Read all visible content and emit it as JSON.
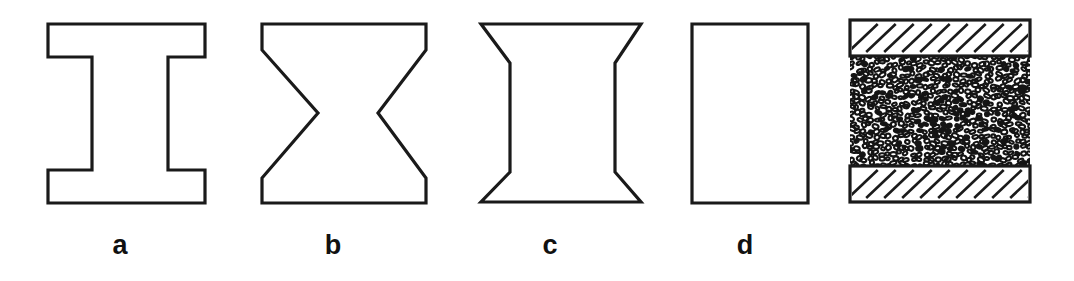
{
  "figure": {
    "kind": "specimen-geometry-diagram",
    "background_color": "#ffffff",
    "line_color": "#1a1a1a",
    "width": 1074,
    "height": 281,
    "panels": [
      {
        "id": "a",
        "label": "a",
        "shape_name": "i-beam-dogbone-specimen",
        "description": "I-shaped specimen with wide square top and bottom flanges and a straight narrow central web",
        "label_x": 120,
        "label_y": 232,
        "outline_points": "48,24 205,24 205,57 168,57 168,170 205,170 205,203 48,203 48,170 92,170 92,57 48,57"
      },
      {
        "id": "b",
        "label": "b",
        "shape_name": "hourglass-bowtie-specimen",
        "description": "Hourglass specimen with straight tapered sides converging to a sharp V notch at mid height",
        "label_x": 333,
        "label_y": 232,
        "outline_points": "262,24 426,24 426,50 378,113 426,178 426,203 262,203 262,178 318,113 262,50"
      },
      {
        "id": "c",
        "label": "c",
        "shape_name": "flared-end-spool-specimen",
        "description": "Spool specimen with short angled flares at top and bottom and a long straight gauge section",
        "label_x": 550,
        "label_y": 232,
        "outline_points": "481,24 641,24 615,63 615,172 641,202 481,202 510,172 510,63"
      },
      {
        "id": "d",
        "label": "d",
        "shape_name": "plain-rectangular-prism-specimen",
        "description": "Plain rectangular specimen with no reduced section",
        "label_x": 745,
        "label_y": 232,
        "outline_points": "692,24 808,24 808,203 692,203"
      },
      {
        "id": "e",
        "label": "",
        "shape_name": "granular-specimen-between-hatched-platens",
        "description": "Granular particulate specimen confined between an upper and a lower cross hatched rigid platen",
        "label_x": null,
        "label_y": null,
        "outline_points": ""
      }
    ],
    "platen_assembly": {
      "left": 850,
      "right": 1030,
      "top_platen": {
        "y": 20,
        "height": 36,
        "hatch_count": 11,
        "hatch_direction": "lower-left-to-upper-right"
      },
      "bottom_platen": {
        "y": 166,
        "height": 36,
        "hatch_count": 11,
        "hatch_direction": "lower-left-to-upper-right"
      },
      "granular_region": {
        "y": 56,
        "height": 110,
        "fill_pattern": "dense-irregular-pebble-rings"
      }
    }
  }
}
